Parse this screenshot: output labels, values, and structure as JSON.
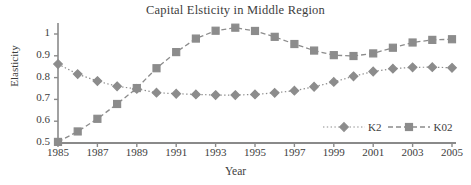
{
  "chart_data": {
    "type": "line",
    "title": "Capital Elsticity in Middle Region",
    "xlabel": "Year",
    "ylabel": "Elasticity",
    "x": [
      1985,
      1986,
      1987,
      1988,
      1989,
      1990,
      1991,
      1992,
      1993,
      1994,
      1995,
      1996,
      1997,
      1998,
      1999,
      2000,
      2001,
      2002,
      2003,
      2004,
      2005
    ],
    "xlim": [
      1985,
      2005
    ],
    "ylim": [
      0.5,
      1.05
    ],
    "yticks": [
      0.5,
      0.6,
      0.7,
      0.8,
      0.9,
      1
    ],
    "ytick_labels": [
      "0.5",
      "0.6",
      "0.7",
      "0.8",
      "0.9",
      "1"
    ],
    "xticks": [
      1985,
      1987,
      1989,
      1991,
      1993,
      1995,
      1997,
      1999,
      2001,
      2003,
      2005
    ],
    "xtick_labels": [
      "1985",
      "1987",
      "1989",
      "1991",
      "1993",
      "1995",
      "1997",
      "1999",
      "2001",
      "2003",
      "2005"
    ],
    "grid": false,
    "legend_position": "lower-right-inside",
    "series": [
      {
        "name": "K2",
        "marker": "diamond",
        "linestyle": "dotted",
        "color": "#8c8c8c",
        "values": [
          0.862,
          0.816,
          0.784,
          0.76,
          0.748,
          0.731,
          0.726,
          0.723,
          0.72,
          0.72,
          0.723,
          0.73,
          0.74,
          0.758,
          0.78,
          0.806,
          0.828,
          0.841,
          0.847,
          0.848,
          0.845
        ]
      },
      {
        "name": "K02",
        "marker": "square",
        "linestyle": "dashed",
        "color": "#8c8c8c",
        "values": [
          0.505,
          0.553,
          0.611,
          0.679,
          0.752,
          0.843,
          0.917,
          0.979,
          1.015,
          1.029,
          1.014,
          0.987,
          0.954,
          0.924,
          0.903,
          0.899,
          0.911,
          0.937,
          0.961,
          0.973,
          0.976
        ]
      }
    ]
  },
  "legend": {
    "items": [
      {
        "label": "K2"
      },
      {
        "label": "K02"
      }
    ]
  },
  "colors": {
    "series": "#8c8c8c",
    "axis": "#8a8a8a",
    "text": "#3d3d3d",
    "background": "#ffffff"
  }
}
